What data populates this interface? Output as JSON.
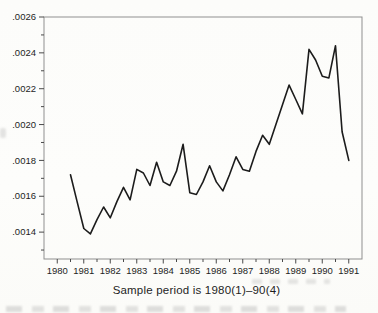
{
  "figure": {
    "caption": "Sample period is 1980(1)–90(4)"
  },
  "chart_data": {
    "type": "line",
    "title": "",
    "xlabel": "Sample period is 1980(1)–90(4)",
    "ylabel": "",
    "grid": false,
    "legend": "none",
    "xlim": [
      1979.5,
      1991.5
    ],
    "ylim": [
      0.00125,
      0.0026
    ],
    "x": [
      1980.5,
      1980.75,
      1981.0,
      1981.25,
      1981.5,
      1981.75,
      1982.0,
      1982.25,
      1982.5,
      1982.75,
      1983.0,
      1983.25,
      1983.5,
      1983.75,
      1984.0,
      1984.25,
      1984.5,
      1984.75,
      1985.0,
      1985.25,
      1985.5,
      1985.75,
      1986.0,
      1986.25,
      1986.5,
      1986.75,
      1987.0,
      1987.25,
      1987.5,
      1987.75,
      1988.0,
      1988.25,
      1988.5,
      1988.75,
      1989.0,
      1989.25,
      1989.5,
      1989.75,
      1990.0,
      1990.25,
      1990.5,
      1990.75,
      1991.0
    ],
    "quarters": [
      "1980(2)",
      "1980(3)",
      "1980(4)",
      "1981(1)",
      "1981(2)",
      "1981(3)",
      "1981(4)",
      "1982(1)",
      "1982(2)",
      "1982(3)",
      "1982(4)",
      "1983(1)",
      "1983(2)",
      "1983(3)",
      "1983(4)",
      "1984(1)",
      "1984(2)",
      "1984(3)",
      "1984(4)",
      "1985(1)",
      "1985(2)",
      "1985(3)",
      "1985(4)",
      "1986(1)",
      "1986(2)",
      "1986(3)",
      "1986(4)",
      "1987(1)",
      "1987(2)",
      "1987(3)",
      "1987(4)",
      "1988(1)",
      "1988(2)",
      "1988(3)",
      "1988(4)",
      "1989(1)",
      "1989(2)",
      "1989(3)",
      "1989(4)",
      "1990(1)",
      "1990(2)",
      "1990(3)",
      "1990(4)"
    ],
    "values": [
      0.00172,
      0.00157,
      0.00142,
      0.00139,
      0.00147,
      0.00154,
      0.00148,
      0.00157,
      0.00165,
      0.00158,
      0.00175,
      0.00173,
      0.00166,
      0.00179,
      0.00168,
      0.00166,
      0.00174,
      0.00189,
      0.00162,
      0.00161,
      0.00168,
      0.00177,
      0.00168,
      0.00163,
      0.00172,
      0.00182,
      0.00175,
      0.00174,
      0.00185,
      0.00194,
      0.00189,
      0.002,
      0.00211,
      0.00222,
      0.00214,
      0.00206,
      0.00242,
      0.00236,
      0.00227,
      0.00226,
      0.00244,
      0.00196,
      0.0018
    ],
    "x_ticks": {
      "major": [
        1980,
        1981,
        1982,
        1983,
        1984,
        1985,
        1986,
        1987,
        1988,
        1989,
        1990,
        1991
      ],
      "labels": [
        "1980",
        "1981",
        "1982",
        "1983",
        "1984",
        "1985",
        "1986",
        "1987",
        "1988",
        "1989",
        "1990",
        "1991"
      ],
      "minor": [
        1980.5,
        1981.5,
        1982.5,
        1983.5,
        1984.5,
        1985.5,
        1986.5,
        1987.5,
        1988.5,
        1989.5,
        1990.5
      ]
    },
    "y_ticks": {
      "major": [
        0.0026,
        0.0024,
        0.0022,
        0.002,
        0.0018,
        0.0016,
        0.0014
      ],
      "labels": [
        ".0026",
        ".0024",
        ".0022",
        ".0020",
        ".0018",
        ".0016",
        ".0014"
      ],
      "minor": [
        0.0025,
        0.0023,
        0.0021,
        0.0019,
        0.0017,
        0.0015,
        0.0013
      ]
    },
    "colors": {
      "line": "#1c1c1c",
      "frame": "#8f8f8f",
      "tick": "#4a4a4a",
      "label": "#1e1e1e",
      "background": "#fdfdfb"
    }
  }
}
